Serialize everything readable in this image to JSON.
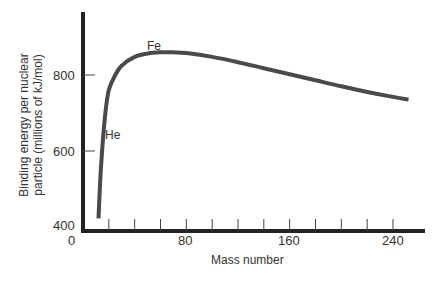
{
  "chart_data": {
    "type": "line",
    "title": "",
    "xlabel": "Mass number",
    "ylabel_line1": "Binding energy per nuclear",
    "ylabel_line2": "particle (millions of kJ/mol)",
    "xlim": [
      0,
      265
    ],
    "ylim": [
      400,
      950
    ],
    "x_ticks": [
      0,
      80,
      160,
      240
    ],
    "x_minor_tick_step": 20,
    "y_ticks": [
      400,
      600,
      800
    ],
    "grid": false,
    "legend": null,
    "series": [
      {
        "name": "Binding energy per nucleon",
        "x": [
          12,
          14,
          17,
          20,
          25,
          30,
          40,
          50,
          60,
          70,
          80,
          100,
          120,
          140,
          160,
          180,
          200,
          220,
          240,
          252
        ],
        "y": [
          420,
          560,
          690,
          760,
          800,
          825,
          848,
          857,
          860,
          860,
          858,
          848,
          834,
          818,
          802,
          786,
          770,
          755,
          742,
          735
        ]
      }
    ],
    "annotations": [
      {
        "text": "He",
        "x": 17,
        "y": 640
      },
      {
        "text": "Fe",
        "x": 58,
        "y": 885
      }
    ]
  },
  "labels": {
    "xlabel": "Mass number",
    "ylabel_line1": "Binding energy per nuclear",
    "ylabel_line2": "particle (millions of kJ/mol)",
    "x_tick_0": "0",
    "x_tick_80": "80",
    "x_tick_160": "160",
    "x_tick_240": "240",
    "y_tick_400": "400",
    "y_tick_600": "600",
    "y_tick_800": "800",
    "annot_he": "He",
    "annot_fe": "Fe"
  },
  "colors": {
    "axis": "#222222",
    "curve": "#4a4a4a",
    "text": "#333333"
  }
}
